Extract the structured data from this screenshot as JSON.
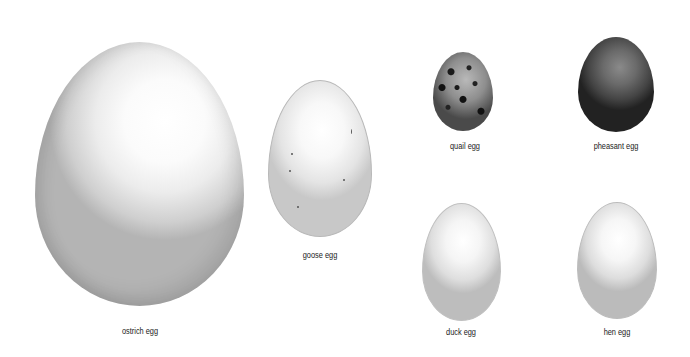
{
  "eggs": [
    {
      "id": "ostrich",
      "label": "ostrich egg"
    },
    {
      "id": "goose",
      "label": "goose egg"
    },
    {
      "id": "quail",
      "label": "quail egg"
    },
    {
      "id": "pheasant",
      "label": "pheasant egg"
    },
    {
      "id": "duck",
      "label": "duck egg"
    },
    {
      "id": "hen",
      "label": "hen egg"
    }
  ]
}
